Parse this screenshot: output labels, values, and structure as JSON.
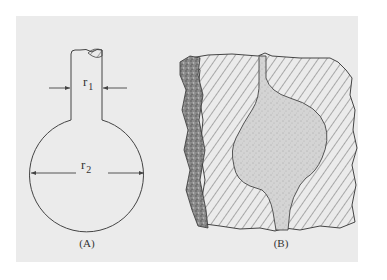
{
  "figure": {
    "background_color": "#ebebeb",
    "line_color": "#444444",
    "panels": [
      {
        "id": "A",
        "label": "(A)",
        "description": "Schematic flask-shaped pore: narrow neck of radius r1 opening into spherical cavity of radius r2",
        "dimensions": [
          {
            "symbol": "r",
            "subscript": "1",
            "meaning": "neck radius"
          },
          {
            "symbol": "r",
            "subscript": "2",
            "meaning": "cavity radius"
          }
        ]
      },
      {
        "id": "B",
        "label": "(B)",
        "description": "Cross-section of rock with hatched solid matrix containing a stippled ink-bottle shaped pore cavity; rough weathered edge on the left"
      }
    ]
  }
}
